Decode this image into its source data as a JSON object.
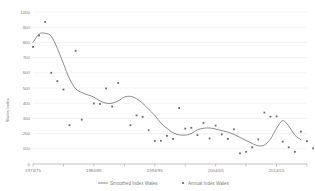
{
  "chart_data": {
    "type": "line",
    "title": "",
    "xlabel": "",
    "ylabel": "Wales Index",
    "ylim": [
      0,
      1000
    ],
    "ytick_labels": [
      "1000",
      "900",
      "800",
      "700",
      "600",
      "500",
      "400",
      "300",
      "200",
      "100",
      "0"
    ],
    "ytick_values": [
      1000,
      900,
      800,
      700,
      600,
      500,
      400,
      300,
      200,
      100,
      0
    ],
    "xtick_labels": [
      "1974/75",
      "1984/85",
      "1994/95",
      "2004/05",
      "2014/15"
    ],
    "xtick_values": [
      1974,
      1984,
      1994,
      2004,
      2014
    ],
    "xlim": [
      1974,
      2019
    ],
    "grid": true,
    "legend_position": "bottom",
    "legend": [
      {
        "name": "Smoothed Index Wales",
        "type": "line"
      },
      {
        "name": "Annual Index Wales",
        "type": "scatter"
      }
    ],
    "series": [
      {
        "name": "Smoothed Index Wales",
        "type": "line",
        "x": [
          1974,
          1975,
          1976,
          1977,
          1978,
          1979,
          1980,
          1981,
          1982,
          1983,
          1984,
          1985,
          1986,
          1987,
          1988,
          1989,
          1990,
          1991,
          1992,
          1993,
          1994,
          1995,
          1996,
          1997,
          1998,
          1999,
          2000,
          2001,
          2002,
          2003,
          2004,
          2005,
          2006,
          2007,
          2008,
          2009,
          2010,
          2011,
          2012,
          2013,
          2014,
          2015,
          2016,
          2017,
          2018
        ],
        "values": [
          800,
          855,
          860,
          840,
          760,
          660,
          560,
          495,
          470,
          455,
          440,
          415,
          400,
          400,
          415,
          440,
          445,
          430,
          400,
          360,
          320,
          270,
          235,
          205,
          192,
          190,
          200,
          225,
          235,
          237,
          230,
          220,
          210,
          195,
          175,
          155,
          135,
          120,
          125,
          165,
          235,
          285,
          250,
          190,
          160
        ]
      },
      {
        "name": "Annual Index Wales",
        "type": "scatter",
        "points": [
          {
            "x": 1974,
            "y": 770
          },
          {
            "x": 1975,
            "y": 845
          },
          {
            "x": 1976,
            "y": 935
          },
          {
            "x": 1977,
            "y": 600
          },
          {
            "x": 1978,
            "y": 545
          },
          {
            "x": 1979,
            "y": 490
          },
          {
            "x": 1980,
            "y": 255
          },
          {
            "x": 1981,
            "y": 745
          },
          {
            "x": 1982,
            "y": 292
          },
          {
            "x": 1984,
            "y": 398
          },
          {
            "x": 1985,
            "y": 395
          },
          {
            "x": 1986,
            "y": 497
          },
          {
            "x": 1987,
            "y": 378
          },
          {
            "x": 1988,
            "y": 533
          },
          {
            "x": 1990,
            "y": 255
          },
          {
            "x": 1991,
            "y": 320
          },
          {
            "x": 1992,
            "y": 310
          },
          {
            "x": 1993,
            "y": 222
          },
          {
            "x": 1994,
            "y": 152
          },
          {
            "x": 1995,
            "y": 153
          },
          {
            "x": 1996,
            "y": 185
          },
          {
            "x": 1997,
            "y": 165
          },
          {
            "x": 1998,
            "y": 368
          },
          {
            "x": 1999,
            "y": 233
          },
          {
            "x": 2000,
            "y": 238
          },
          {
            "x": 2001,
            "y": 190
          },
          {
            "x": 2002,
            "y": 270
          },
          {
            "x": 2003,
            "y": 168
          },
          {
            "x": 2004,
            "y": 253
          },
          {
            "x": 2005,
            "y": 195
          },
          {
            "x": 2006,
            "y": 165
          },
          {
            "x": 2007,
            "y": 228
          },
          {
            "x": 2008,
            "y": 70
          },
          {
            "x": 2009,
            "y": 80
          },
          {
            "x": 2010,
            "y": 110
          },
          {
            "x": 2011,
            "y": 162
          },
          {
            "x": 2012,
            "y": 338
          },
          {
            "x": 2013,
            "y": 312
          },
          {
            "x": 2014,
            "y": 313
          },
          {
            "x": 2015,
            "y": 147
          },
          {
            "x": 2016,
            "y": 110
          },
          {
            "x": 2017,
            "y": 80
          },
          {
            "x": 2018,
            "y": 213
          },
          {
            "x": 2019,
            "y": 150
          },
          {
            "x": 2020,
            "y": 103
          }
        ]
      }
    ]
  }
}
